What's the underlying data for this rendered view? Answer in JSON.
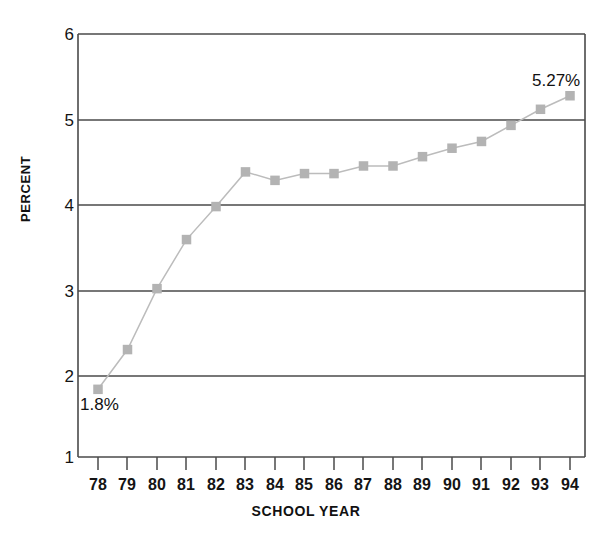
{
  "chart_data": {
    "type": "line",
    "title": "",
    "subtitle": "",
    "xlabel": "SCHOOL YEAR",
    "ylabel": "PERCENT",
    "categories": [
      "78",
      "79",
      "80",
      "81",
      "82",
      "83",
      "84",
      "85",
      "86",
      "87",
      "88",
      "89",
      "90",
      "91",
      "92",
      "93",
      "94"
    ],
    "values": [
      1.8,
      2.27,
      2.99,
      3.57,
      3.96,
      4.37,
      4.27,
      4.35,
      4.35,
      4.44,
      4.44,
      4.55,
      4.65,
      4.73,
      4.92,
      5.11,
      5.27
    ],
    "ylim": [
      1,
      6
    ],
    "yticks": [
      "1",
      "2",
      "3",
      "4",
      "5",
      "6"
    ],
    "ytick_values": [
      1,
      2,
      3,
      4,
      5,
      6
    ],
    "grid": "horizontal",
    "legend": "none",
    "annotations": [
      {
        "label": "1.8%",
        "point_index": 0,
        "position": "below-right"
      },
      {
        "label": "5.27%",
        "point_index": 16,
        "position": "above-left"
      }
    ],
    "marker": "square",
    "marker_color": "#b3b3b3",
    "line_color": "#bcbcbc",
    "axis_color": "#3a3a3a",
    "grid_color": "#4a4a4a"
  },
  "axes": {
    "y_title": "PERCENT",
    "x_title": "SCHOOL YEAR"
  }
}
